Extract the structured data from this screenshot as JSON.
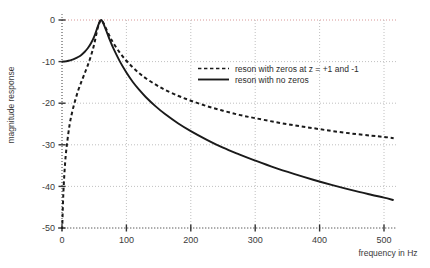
{
  "chart_data": {
    "type": "line",
    "title": "",
    "xlabel": "frequency in Hz",
    "ylabel": "magnitude response",
    "xlim": [
      0,
      520
    ],
    "ylim": [
      -52,
      2
    ],
    "xticks": [
      0,
      100,
      200,
      300,
      400,
      500
    ],
    "yticks": [
      0,
      -10,
      -20,
      -30,
      -40,
      -50
    ],
    "xticklabels": [
      "0",
      "100",
      "200",
      "300",
      "400",
      "500"
    ],
    "yticklabels": [
      "0",
      "-10",
      "-20",
      "-30",
      "-40",
      "-50"
    ],
    "grid": true,
    "grid_style": "dotted",
    "legend_position": "upper right inside",
    "series": [
      {
        "name": "reson with zeros at  z = +1 and -1",
        "style": "dashed",
        "color": "#1a1a1a",
        "x": [
          0,
          2,
          5,
          8,
          12,
          16,
          20,
          25,
          30,
          35,
          40,
          45,
          50,
          55,
          58,
          60,
          62,
          65,
          70,
          75,
          80,
          90,
          100,
          110,
          120,
          130,
          145,
          160,
          180,
          200,
          225,
          250,
          275,
          300,
          330,
          360,
          390,
          420,
          450,
          480,
          500,
          515
        ],
        "y": [
          -52.0,
          -42.0,
          -34.0,
          -29.5,
          -25.0,
          -22.0,
          -19.6,
          -17.0,
          -14.9,
          -12.9,
          -10.9,
          -8.6,
          -5.8,
          -2.2,
          -0.7,
          -0.05,
          -0.1,
          -0.9,
          -2.6,
          -4.2,
          -5.6,
          -7.9,
          -9.8,
          -11.4,
          -12.8,
          -14.0,
          -15.5,
          -16.8,
          -18.2,
          -19.4,
          -20.7,
          -21.8,
          -22.8,
          -23.6,
          -24.5,
          -25.3,
          -26.0,
          -26.7,
          -27.3,
          -27.8,
          -28.1,
          -28.4
        ]
      },
      {
        "name": "reson with no zeros",
        "style": "solid",
        "color": "#1a1a1a",
        "x": [
          0,
          5,
          10,
          15,
          20,
          25,
          30,
          35,
          40,
          45,
          50,
          55,
          58,
          60,
          62,
          65,
          70,
          75,
          80,
          90,
          100,
          110,
          120,
          130,
          145,
          160,
          180,
          200,
          225,
          250,
          275,
          300,
          330,
          360,
          390,
          420,
          450,
          480,
          500,
          515
        ],
        "y": [
          -10.0,
          -9.95,
          -9.8,
          -9.6,
          -9.3,
          -8.9,
          -8.4,
          -7.7,
          -6.8,
          -5.6,
          -4.0,
          -1.8,
          -0.6,
          -0.05,
          -0.15,
          -1.1,
          -3.1,
          -5.1,
          -6.9,
          -10.0,
          -12.6,
          -14.9,
          -16.8,
          -18.5,
          -20.7,
          -22.6,
          -24.8,
          -26.7,
          -28.8,
          -30.7,
          -32.3,
          -33.8,
          -35.5,
          -37.0,
          -38.4,
          -39.7,
          -40.9,
          -42.0,
          -42.7,
          -43.3
        ]
      }
    ],
    "colors": {
      "grid": "#b9b9b9",
      "zero_gridline": "#d28a8a",
      "axis": "#4a4a4a",
      "curve": "#1a1a1a",
      "background": "#ffffff"
    }
  },
  "legend": {
    "entries": [
      {
        "label": "reson with zeros at  z = +1 and -1",
        "style": "dashed"
      },
      {
        "label": "reson with no zeros",
        "style": "solid"
      }
    ]
  },
  "axes": {
    "x_title": "frequency in Hz",
    "y_title": "magnitude response"
  }
}
